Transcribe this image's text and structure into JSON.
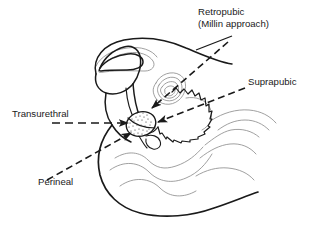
{
  "figure": {
    "type": "anatomical-diagram",
    "background_color": "#ffffff",
    "ink_color": "#1a1a1a",
    "secondary_ink_color": "#8c8c8c",
    "width": 309,
    "height": 227
  },
  "labels": {
    "retropubic": {
      "line1": "Retropubic",
      "line2": "(Millin approach)",
      "x": 198,
      "y": 15,
      "anchor": "start"
    },
    "suprapubic": {
      "text": "Suprapubic",
      "x": 248,
      "y": 85,
      "anchor": "start"
    },
    "transurethral": {
      "text": "Transurethral",
      "x": 12,
      "y": 117,
      "anchor": "start"
    },
    "perineal": {
      "text": "Perineal",
      "x": 38,
      "y": 185,
      "anchor": "start"
    }
  },
  "approaches": [
    {
      "name": "retropubic",
      "label": "Retropubic (Millin approach)",
      "arrow_direction": "from upper-right down to prostate"
    },
    {
      "name": "suprapubic",
      "label": "Suprapubic",
      "arrow_direction": "from right down-left to prostate"
    },
    {
      "name": "transurethral",
      "label": "Transurethral",
      "arrow_direction": "horizontal from left to prostate"
    },
    {
      "name": "perineal",
      "label": "Perineal",
      "arrow_direction": "from lower-left up to prostate"
    }
  ],
  "anatomy": {
    "prostate": "stippled oval gland at center",
    "bladder": "scalloped-wall organ above prostate",
    "seminal_vesicle": "concentric oval structure upper-left of bladder",
    "abdominal_wall": "heavy dark contour across upper left",
    "pelvic_floor": "light gray curves in lower region",
    "body_contour": "heavy dark arc along lower left and bottom"
  }
}
